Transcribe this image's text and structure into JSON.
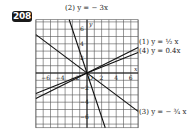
{
  "problem_number": "208",
  "graph": {
    "x_range": [
      -7,
      7
    ],
    "y_range": [
      -7.5,
      7.5
    ],
    "x_ticks": [
      "-6",
      "-4",
      "-2",
      "O",
      "2",
      "4",
      "6"
    ],
    "y_ticks": [
      "6",
      "4",
      "2",
      "-2",
      "-4",
      "-6"
    ],
    "x_axis_label": "x",
    "y_axis_label": "y",
    "origin_label": "O"
  },
  "lines": [
    {
      "id": "1",
      "label": "(1) y = ½x",
      "slope": 0.5
    },
    {
      "id": "2",
      "label": "(2) y = − 3x",
      "slope": -3
    },
    {
      "id": "3",
      "label": "(3) y = − ¾x",
      "slope": -0.75
    },
    {
      "id": "4",
      "label": "(4) y = 0.4x",
      "slope": 0.4
    }
  ],
  "labels": {
    "line2": "(2) y = − 3x",
    "line1": "(1) y = ½ x",
    "line4": "(4) y = 0.4x",
    "line3": "(3) y = − ¾ x"
  }
}
